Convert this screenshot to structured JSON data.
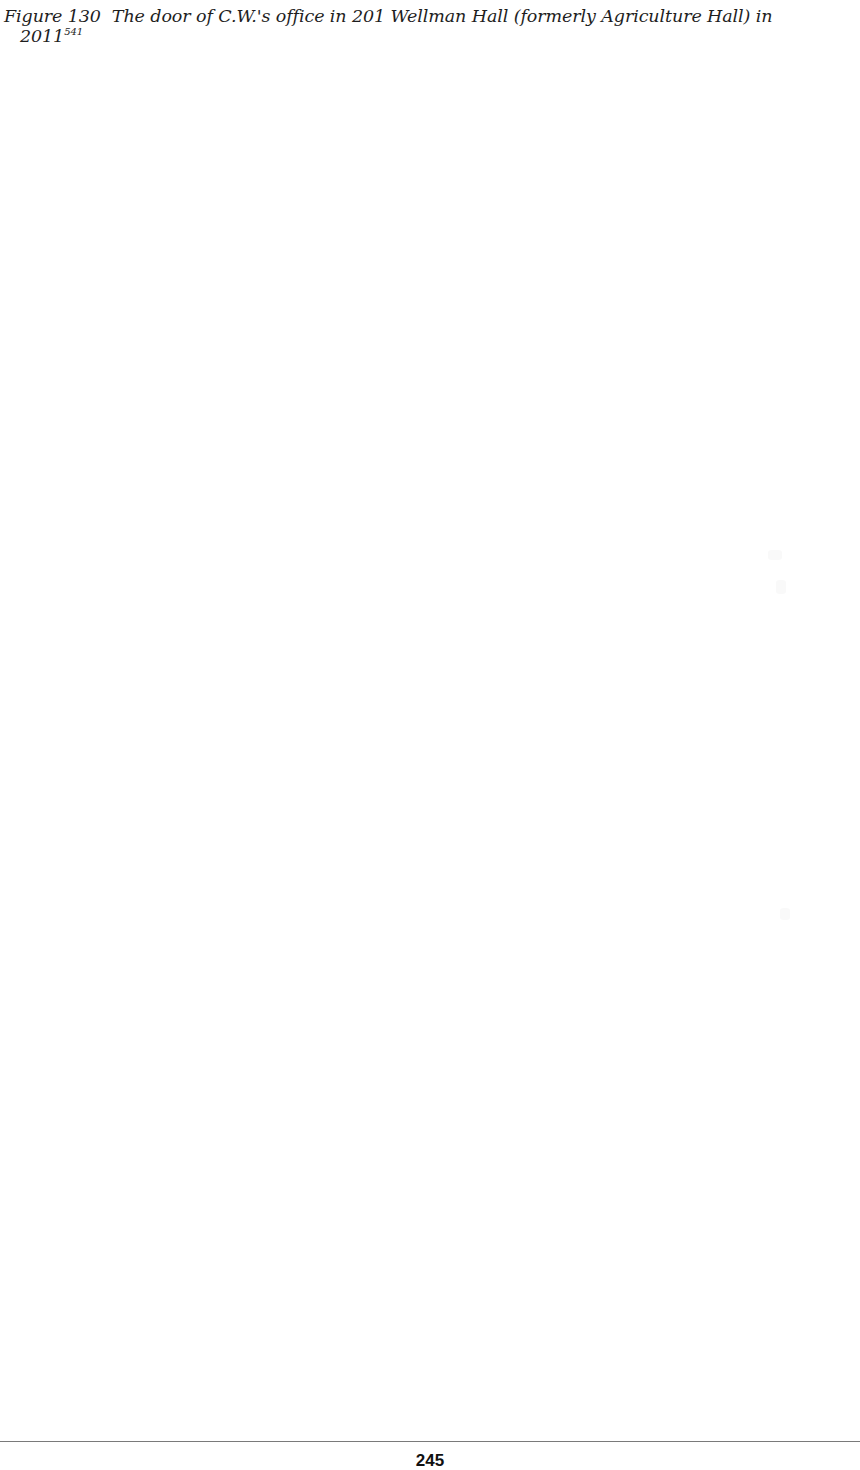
{
  "caption": {
    "label": "Figure 130",
    "text": "The door of C.W.'s office in 201 Wellman Hall (formerly Agriculture Hall) in",
    "continuation": "2011",
    "footnote_ref": "541"
  },
  "footer": {
    "page_number": "245"
  }
}
